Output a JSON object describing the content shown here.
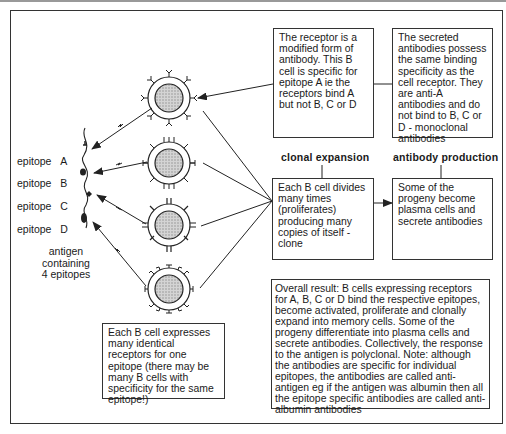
{
  "epitopes": [
    {
      "label": "epitope",
      "letter": "A"
    },
    {
      "label": "epitope",
      "letter": "B"
    },
    {
      "label": "epitope",
      "letter": "C"
    },
    {
      "label": "epitope",
      "letter": "D"
    }
  ],
  "antigen_note": {
    "line1": "antigen",
    "line2": "containing",
    "line3": "4  epitopes"
  },
  "receptor_box": {
    "text": "The receptor is a modified form of antibody. This B cell is specific for epitope A ie the receptors bind A but not B, C or D"
  },
  "secreted_box": {
    "text": "The secreted antibodies possess the same binding specificity as the cell receptor. They are anti-A antibodies and do not bind to B, C or D - monoclonal antibodies"
  },
  "clonal_expansion": {
    "heading": "clonal expansion",
    "text": "Each B cell divides many times (proliferates) producing many copies of itself - clone"
  },
  "antibody_production": {
    "heading": "antibody production",
    "text": "Some of the progeny become plasma cells and secrete antibodies"
  },
  "bcell_box": {
    "text": "Each B cell expresses many identical receptors for one epitope (there may be many B cells with specificity for the same epitope!)"
  },
  "overall_box": {
    "text": "Overall result: B cells expressing receptors for A, B, C or D bind the respective epitopes, become activated, proliferate and clonally expand into memory cells. Some of the progeny differentiate into plasma cells and secrete antibodies. Collectively, the response to the antigen is polyclonal. Note: although the antibodies are specific for individual epitopes, the antibodies are called anti-antigen eg if the antigen was albumin then all the epitope specific antibodies are called anti-albumin antibodies"
  },
  "colors": {
    "line": "#222222",
    "cell_fill": "#cccccc",
    "border": "#333333"
  }
}
